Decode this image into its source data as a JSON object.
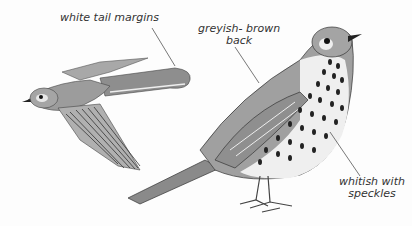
{
  "illustration": {
    "subject": "mistle thrush field-guide illustration",
    "labels": {
      "tail": "white tail margins",
      "back_line1": "greyish- brown",
      "back_line2": "back",
      "belly_line1": "whitish with",
      "belly_line2": "speckles"
    },
    "colors": {
      "background": "#fdfdfd",
      "plumage": "#9a9a9a",
      "dark": "#2a2a2a",
      "belly": "#efefef",
      "ink": "#333333"
    }
  }
}
